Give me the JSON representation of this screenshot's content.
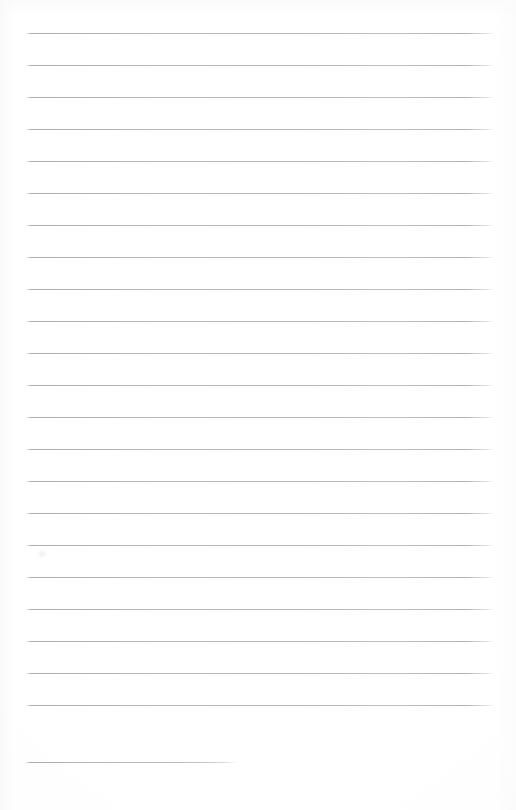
{
  "document": {
    "kind": "scanned-lined-paper",
    "title": "Blank Lined Notepaper",
    "content_text": "",
    "page_width": 516,
    "page_height": 810,
    "background_color": "#fefefe",
    "rule_color": "#b6b6ba",
    "rule_thickness_px": 1,
    "rule_spacing_px": 32,
    "first_rule_y": 33,
    "rule_left_x": 26,
    "rule_right_x": 495,
    "full_rule_width": 469,
    "short_rule_width": 211,
    "total_rules": 24,
    "full_rules": 23,
    "short_rules": 1,
    "skipped_rule_y": 729,
    "rules": [
      {
        "index": 1,
        "y": 33,
        "x": 26,
        "width": 469,
        "style": "full"
      },
      {
        "index": 2,
        "y": 65,
        "x": 26,
        "width": 469,
        "style": "full"
      },
      {
        "index": 3,
        "y": 97,
        "x": 26,
        "width": 469,
        "style": "full"
      },
      {
        "index": 4,
        "y": 129,
        "x": 26,
        "width": 469,
        "style": "full"
      },
      {
        "index": 5,
        "y": 161,
        "x": 26,
        "width": 469,
        "style": "full"
      },
      {
        "index": 6,
        "y": 193,
        "x": 26,
        "width": 469,
        "style": "full"
      },
      {
        "index": 7,
        "y": 225,
        "x": 26,
        "width": 469,
        "style": "full"
      },
      {
        "index": 8,
        "y": 257,
        "x": 26,
        "width": 469,
        "style": "full"
      },
      {
        "index": 9,
        "y": 289,
        "x": 26,
        "width": 469,
        "style": "full"
      },
      {
        "index": 10,
        "y": 321,
        "x": 26,
        "width": 469,
        "style": "full"
      },
      {
        "index": 11,
        "y": 353,
        "x": 26,
        "width": 469,
        "style": "full"
      },
      {
        "index": 12,
        "y": 385,
        "x": 26,
        "width": 469,
        "style": "full"
      },
      {
        "index": 13,
        "y": 417,
        "x": 26,
        "width": 469,
        "style": "full"
      },
      {
        "index": 14,
        "y": 449,
        "x": 26,
        "width": 469,
        "style": "full"
      },
      {
        "index": 15,
        "y": 481,
        "x": 26,
        "width": 469,
        "style": "full"
      },
      {
        "index": 16,
        "y": 513,
        "x": 26,
        "width": 469,
        "style": "full"
      },
      {
        "index": 17,
        "y": 545,
        "x": 26,
        "width": 469,
        "style": "full"
      },
      {
        "index": 18,
        "y": 577,
        "x": 26,
        "width": 469,
        "style": "full"
      },
      {
        "index": 19,
        "y": 609,
        "x": 26,
        "width": 469,
        "style": "full"
      },
      {
        "index": 20,
        "y": 641,
        "x": 26,
        "width": 469,
        "style": "full"
      },
      {
        "index": 21,
        "y": 673,
        "x": 26,
        "width": 469,
        "style": "full"
      },
      {
        "index": 22,
        "y": 705,
        "x": 26,
        "width": 469,
        "style": "full"
      },
      {
        "index": 23,
        "y": 762,
        "x": 26,
        "width": 211,
        "style": "short"
      }
    ],
    "artifacts": [
      {
        "name": "scan-smudge",
        "x": 36,
        "y": 549,
        "width": 12,
        "height": 10
      }
    ]
  }
}
